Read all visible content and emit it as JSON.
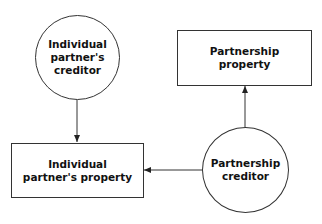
{
  "diagram": {
    "type": "flow",
    "nodes": [
      {
        "id": "individual-partners-creditor",
        "shape": "circle",
        "label": "Individual\npartner's\ncreditor"
      },
      {
        "id": "partnership-property",
        "shape": "rectangle",
        "label": "Partnership\nproperty"
      },
      {
        "id": "individual-partners-property",
        "shape": "rectangle",
        "label": "Individual\npartner's property"
      },
      {
        "id": "partnership-creditor",
        "shape": "circle",
        "label": "Partnership\ncreditor"
      }
    ],
    "edges": [
      {
        "from": "individual-partners-creditor",
        "to": "individual-partners-property",
        "direction": "down"
      },
      {
        "from": "partnership-creditor",
        "to": "partnership-property",
        "direction": "up"
      },
      {
        "from": "partnership-creditor",
        "to": "individual-partners-property",
        "direction": "left"
      }
    ],
    "colors": {
      "stroke": "#333333",
      "text": "#111111",
      "background": "#ffffff"
    }
  }
}
